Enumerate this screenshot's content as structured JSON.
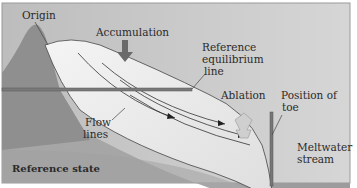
{
  "diagram": {
    "labels": {
      "origin": "Origin",
      "accumulation": "Accumulation",
      "reference_line_1": "Reference",
      "reference_line_2": "equilibrium",
      "reference_line_3": "line",
      "ablation": "Ablation",
      "toe_1": "Position of",
      "toe_2": "toe",
      "flow_1": "Flow",
      "flow_2": "lines",
      "meltwater_1": "Meltwater",
      "meltwater_2": "stream",
      "state": "Reference state"
    },
    "colors": {
      "sky": "#c9c9c9",
      "ground": "#a8a8a8",
      "mountain": "#8e8e8e",
      "ice": "#eeeeee",
      "arrow_down": "#6a6a6a",
      "arrow_up": "#bdbdbd",
      "border": "#9a9a9a"
    }
  }
}
